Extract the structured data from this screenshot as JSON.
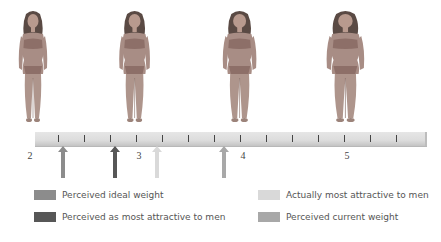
{
  "figures": [
    {
      "id": "figure-1",
      "body_size_value": 2,
      "center_x": 33,
      "build": "thin"
    },
    {
      "id": "figure-2",
      "body_size_value": 3,
      "center_x": 135,
      "build": "slim"
    },
    {
      "id": "figure-3",
      "body_size_value": 4,
      "center_x": 240,
      "build": "medium"
    },
    {
      "id": "figure-4",
      "body_size_value": 5,
      "center_x": 345,
      "build": "heavy"
    }
  ],
  "scale": {
    "labels": [
      "2",
      "3",
      "4",
      "5"
    ],
    "label_values": [
      2,
      3,
      4,
      5
    ],
    "minor_ticks_per_unit": 4
  },
  "markers": [
    {
      "name": "Perceived ideal weight",
      "value": 2.3,
      "color": "#8c8c8c"
    },
    {
      "name": "Perceived as most attractive to men",
      "value": 2.8,
      "color": "#575757"
    },
    {
      "name": "Actually most attractive to men",
      "value": 3.2,
      "color": "#d9d9d9"
    },
    {
      "name": "Perceived current weight",
      "value": 3.85,
      "color": "#a8a8a8"
    }
  ],
  "legend": {
    "items": [
      {
        "label": "Perceived ideal weight",
        "color": "#8c8c8c"
      },
      {
        "label": "Perceived as most attractive to men",
        "color": "#575757"
      },
      {
        "label": "Actually most attractive to men",
        "color": "#d9d9d9"
      },
      {
        "label": "Perceived current weight",
        "color": "#a8a8a8"
      }
    ]
  },
  "chart_data": {
    "type": "scatter",
    "title": "",
    "xlabel": "Body size rating",
    "ylabel": "",
    "x_ticks": [
      2,
      3,
      4,
      5
    ],
    "xlim": [
      2,
      5.8
    ],
    "series": [
      {
        "name": "Perceived ideal weight",
        "values": [
          2.3
        ]
      },
      {
        "name": "Perceived as most attractive to men",
        "values": [
          2.8
        ]
      },
      {
        "name": "Actually most attractive to men",
        "values": [
          3.2
        ]
      },
      {
        "name": "Perceived current weight",
        "values": [
          3.85
        ]
      }
    ],
    "legend_position": "bottom"
  }
}
